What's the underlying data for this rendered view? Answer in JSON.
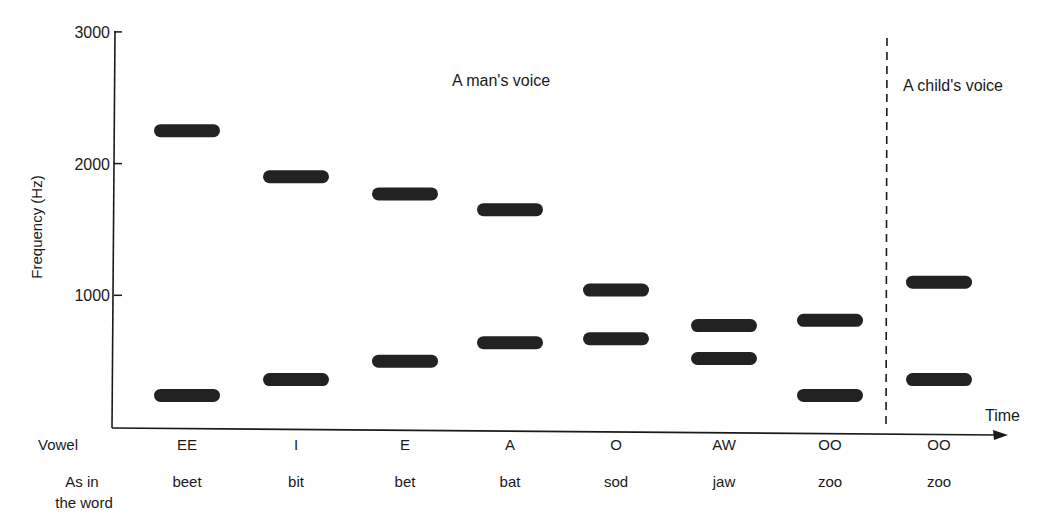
{
  "chart_data": {
    "type": "bar",
    "subtype": "formant-range-bars",
    "title": "",
    "xlabel": "Time",
    "ylabel": "Frequency (Hz)",
    "ylim": [
      0,
      3000
    ],
    "yticks": [
      1000,
      2000,
      3000
    ],
    "grid": false,
    "annotations": [
      "A man's voice",
      "A child's voice"
    ],
    "row_labels": {
      "vowel": "Vowel",
      "word_line1": "As in",
      "word_line2": "the word"
    },
    "categories": [
      {
        "vowel": "EE",
        "word": "beet",
        "group": "man"
      },
      {
        "vowel": "I",
        "word": "bit",
        "group": "man"
      },
      {
        "vowel": "E",
        "word": "bet",
        "group": "man"
      },
      {
        "vowel": "A",
        "word": "bat",
        "group": "man"
      },
      {
        "vowel": "O",
        "word": "sod",
        "group": "man"
      },
      {
        "vowel": "AW",
        "word": "jaw",
        "group": "man"
      },
      {
        "vowel": "OO",
        "word": "zoo",
        "group": "man"
      },
      {
        "vowel": "OO",
        "word": "zoo",
        "group": "child"
      }
    ],
    "series": [
      {
        "name": "Second formant (upper bar)",
        "values": [
          2250,
          1900,
          1770,
          1650,
          1040,
          770,
          810,
          1100
        ]
      },
      {
        "name": "First formant (lower bar)",
        "values": [
          240,
          360,
          500,
          640,
          670,
          520,
          240,
          360
        ]
      }
    ]
  },
  "layout": {
    "y_px_zero": 427,
    "y_px_per_hz": 0.1317,
    "bar_centers_x": [
      187,
      296,
      405,
      510,
      616,
      724,
      830,
      939
    ],
    "bar_width": 66,
    "bar_height": 13,
    "divider_x": 887,
    "colors": {
      "ink": "#1a1a1a",
      "bar": "#222222"
    }
  }
}
